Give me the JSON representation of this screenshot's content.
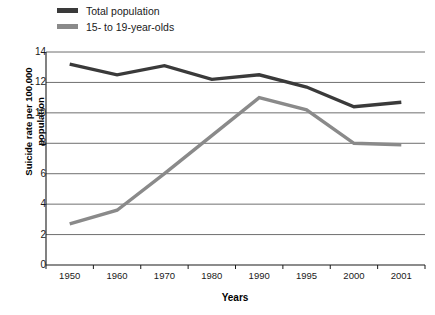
{
  "chart_data": {
    "type": "line",
    "title": "",
    "xlabel": "Years",
    "ylabel": "Suicide rate per 100,000 population",
    "ylabel_line1": "Suicide rate per 100,000",
    "ylabel_line2": "population",
    "categories": [
      "1950",
      "1960",
      "1970",
      "1980",
      "1990",
      "1995",
      "2000",
      "2001"
    ],
    "yticks": [
      "14",
      "12",
      "10",
      "8",
      "6",
      "4",
      "2",
      "0"
    ],
    "ylim": [
      0,
      14
    ],
    "grid": "horizontal",
    "legend_position": "top-left",
    "series": [
      {
        "name": "Total population",
        "color": "#3a3a3a",
        "values": [
          13.2,
          12.5,
          13.1,
          12.2,
          12.5,
          11.7,
          10.4,
          10.7
        ]
      },
      {
        "name": "15- to 19-year-olds",
        "color": "#8a8a8a",
        "values": [
          2.7,
          3.6,
          6.0,
          8.5,
          11.0,
          10.2,
          8.0,
          7.9
        ]
      }
    ]
  }
}
